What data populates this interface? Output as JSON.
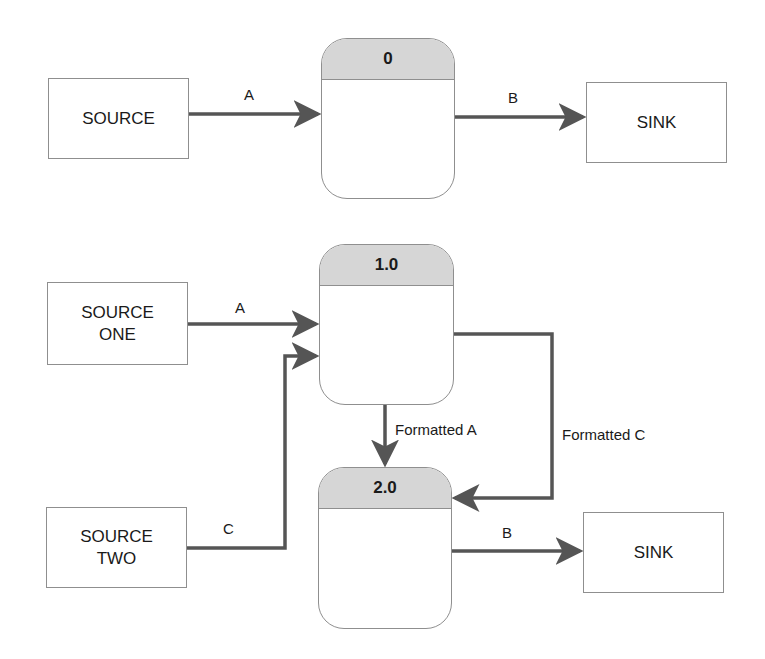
{
  "diagram": {
    "top": {
      "source": {
        "label": "SOURCE"
      },
      "process": {
        "id": "0"
      },
      "sink": {
        "label": "SINK"
      },
      "flows": [
        {
          "from": "SOURCE",
          "to": "0",
          "label": "A"
        },
        {
          "from": "0",
          "to": "SINK",
          "label": "B"
        }
      ]
    },
    "bottom": {
      "source_one": {
        "label": "SOURCE\nONE"
      },
      "source_two": {
        "label": "SOURCE\nTWO"
      },
      "process1": {
        "id": "1.0"
      },
      "process2": {
        "id": "2.0"
      },
      "sink": {
        "label": "SINK"
      },
      "flows": [
        {
          "from": "SOURCE ONE",
          "to": "1.0",
          "label": "A"
        },
        {
          "from": "SOURCE TWO",
          "to": "1.0",
          "label": "C"
        },
        {
          "from": "1.0",
          "to": "2.0",
          "label": "Formatted A"
        },
        {
          "from": "1.0",
          "to": "2.0",
          "label": "Formatted C"
        },
        {
          "from": "2.0",
          "to": "SINK",
          "label": "B"
        }
      ]
    },
    "colors": {
      "arrow": "#555555",
      "border": "#8f8f8f",
      "header_fill": "#d6d6d6",
      "background": "#ffffff"
    }
  }
}
